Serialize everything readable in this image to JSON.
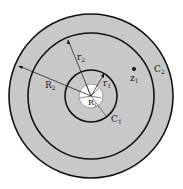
{
  "diagram": {
    "labels": {
      "r2": "r",
      "r2_sub": "2",
      "R2": "R",
      "R2_sub": "2",
      "r1": "r",
      "r1_sub": "1",
      "R1": "R",
      "R1_sub": "1",
      "z1": "z",
      "z1_sub": "1",
      "C1": "C",
      "C1_sub": "1",
      "C2": "C",
      "C2_sub": "2"
    },
    "colors": {
      "annulus_fill": "#c8c8c8",
      "stroke": "#111111",
      "inner_disk": "#ffffff"
    }
  }
}
